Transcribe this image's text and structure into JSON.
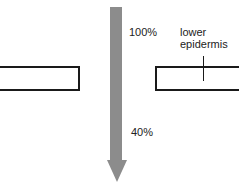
{
  "diagram": {
    "arrow": {
      "color": "#8c8c8c",
      "direction": "down"
    },
    "labels": {
      "top_percent": "100%",
      "mid_percent": "40%",
      "layer_line1": "lower",
      "layer_line2": "epidermis"
    },
    "colors": {
      "outline": "#1a1a1a",
      "background": "#ffffff"
    }
  }
}
